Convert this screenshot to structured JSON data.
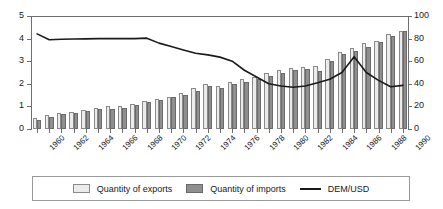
{
  "chart_data": {
    "type": "bar",
    "title": "",
    "subtitle": "",
    "xlabel": "",
    "ylabel": "",
    "grid": false,
    "legend_position": "bottom",
    "axes": {
      "left": {
        "label": "",
        "ylim": [
          0,
          5
        ],
        "ticks": [
          "0",
          "1",
          "2",
          "3",
          "4",
          "5"
        ],
        "series": [
          "DEM/USD"
        ]
      },
      "right": {
        "label": "",
        "ylim": [
          0,
          100
        ],
        "ticks": [
          "0",
          "20",
          "40",
          "60",
          "80",
          "100"
        ],
        "series": [
          "Quantity of exports",
          "Quantity of imports"
        ]
      }
    },
    "categories": [
      "1960",
      "1961",
      "1962",
      "1963",
      "1964",
      "1965",
      "1966",
      "1967",
      "1968",
      "1969",
      "1970",
      "1971",
      "1972",
      "1973",
      "1974",
      "1975",
      "1976",
      "1977",
      "1978",
      "1979",
      "1980",
      "1981",
      "1982",
      "1983",
      "1984",
      "1985",
      "1986",
      "1987",
      "1988",
      "1989",
      "1990"
    ],
    "tick_labels": [
      "1960",
      "1962",
      "1964",
      "1966",
      "1968",
      "1970",
      "1972",
      "1974",
      "1976",
      "1978",
      "1980",
      "1982",
      "1984",
      "1986",
      "1988",
      "1990"
    ],
    "series": [
      {
        "name": "Quantity of exports",
        "axis": "right",
        "color": "#ebebeb",
        "values": [
          10,
          12,
          14,
          15,
          17,
          19,
          20,
          20,
          22,
          25,
          27,
          28,
          32,
          36,
          40,
          38,
          42,
          44,
          46,
          50,
          52,
          54,
          55,
          56,
          62,
          68,
          72,
          76,
          78,
          84,
          87
        ]
      },
      {
        "name": "Quantity of imports",
        "axis": "right",
        "color": "#8f8f8f",
        "values": [
          8,
          11,
          13,
          14,
          16,
          18,
          18,
          19,
          21,
          24,
          26,
          28,
          30,
          34,
          38,
          36,
          40,
          42,
          44,
          47,
          50,
          52,
          53,
          51,
          60,
          66,
          69,
          73,
          77,
          82,
          87
        ]
      },
      {
        "name": "DEM/USD",
        "axis": "left",
        "color": "#1a1a1a",
        "values": [
          4.21,
          3.95,
          3.97,
          3.98,
          3.99,
          4.0,
          4.0,
          4.0,
          4.0,
          4.02,
          3.8,
          3.65,
          3.5,
          3.35,
          3.28,
          3.18,
          3.0,
          2.6,
          2.3,
          2.0,
          1.9,
          1.85,
          1.9,
          2.05,
          2.2,
          2.5,
          3.2,
          2.5,
          2.15,
          1.87,
          1.93
        ],
        "note_values_after_1985": [
          2.5,
          2.15,
          1.87,
          1.93,
          2.07,
          2.0,
          1.97
        ]
      }
    ]
  },
  "legend": {
    "items": [
      {
        "label": "Quantity of exports",
        "marker": "light-square"
      },
      {
        "label": "Quantity of imports",
        "marker": "dark-square"
      },
      {
        "label": "DEM/USD",
        "marker": "line"
      }
    ]
  }
}
